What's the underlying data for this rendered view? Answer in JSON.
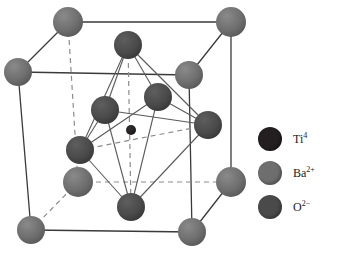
{
  "figure": {
    "background_color": "#ffffff"
  },
  "colors": {
    "titanium": "#231f20",
    "barium": "#6e6e6e",
    "oxygen": "#4a4a4a",
    "edge_solid": "#3a3a3a",
    "edge_dashed": "#8c8c8c",
    "bond": "#5a5a5a"
  },
  "legend": {
    "items": [
      {
        "symbol": "Ti",
        "charge": "4",
        "label": "Ti4",
        "color": "#231f20",
        "radius": 12
      },
      {
        "symbol": "Ba",
        "charge": "2+",
        "label": "Ba2+",
        "color": "#6e6e6e",
        "radius": 12
      },
      {
        "symbol": "O",
        "charge": "2−",
        "label": "O2−",
        "color": "#4a4a4a",
        "radius": 12
      }
    ]
  },
  "structure": {
    "cube": {
      "front_top_left": [
        18,
        72
      ],
      "front_top_right": [
        189,
        75
      ],
      "front_bottom_left": [
        31,
        230
      ],
      "front_bottom_right": [
        192,
        232
      ],
      "back_top_left": [
        68,
        22
      ],
      "back_top_right": [
        231,
        22
      ],
      "back_bottom_left": [
        78,
        182
      ],
      "back_bottom_right": [
        231,
        182
      ]
    },
    "atoms": {
      "barium": [
        {
          "name": "ba-front-top-left",
          "x": 18,
          "y": 72,
          "r": 14
        },
        {
          "name": "ba-front-top-right",
          "x": 189,
          "y": 75,
          "r": 14
        },
        {
          "name": "ba-front-bottom-left",
          "x": 31,
          "y": 230,
          "r": 14
        },
        {
          "name": "ba-front-bottom-right",
          "x": 192,
          "y": 232,
          "r": 14
        },
        {
          "name": "ba-back-top-left",
          "x": 68,
          "y": 22,
          "r": 15
        },
        {
          "name": "ba-back-top-right",
          "x": 231,
          "y": 22,
          "r": 15
        },
        {
          "name": "ba-back-bottom-left",
          "x": 78,
          "y": 182,
          "r": 15
        },
        {
          "name": "ba-back-bottom-right",
          "x": 231,
          "y": 182,
          "r": 15
        }
      ],
      "oxygen": [
        {
          "name": "o-face-top",
          "x": 128,
          "y": 45,
          "r": 14
        },
        {
          "name": "o-face-bottom",
          "x": 131,
          "y": 207,
          "r": 14
        },
        {
          "name": "o-face-left",
          "x": 80,
          "y": 150,
          "r": 14
        },
        {
          "name": "o-face-right",
          "x": 208,
          "y": 125,
          "r": 14
        },
        {
          "name": "o-face-front",
          "x": 105,
          "y": 110,
          "r": 14
        },
        {
          "name": "o-face-back",
          "x": 158,
          "y": 97,
          "r": 14
        }
      ],
      "titanium": [
        {
          "name": "ti-body-center",
          "x": 131,
          "y": 130,
          "r": 5
        }
      ]
    }
  }
}
